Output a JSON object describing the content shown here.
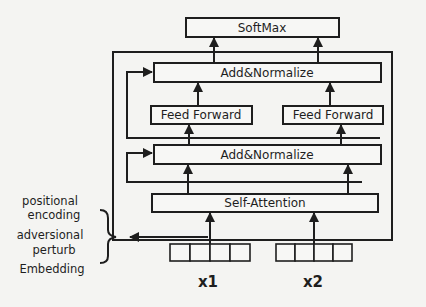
{
  "diagram": {
    "blocks": {
      "softmax": "SoftMax",
      "add_norm_top": "Add&Normalize",
      "feed_forward_left": "Feed Forward",
      "feed_forward_right": "Feed Forward",
      "add_norm_bottom": "Add&Normalize",
      "self_attention": "Self-Attention"
    },
    "side_labels": {
      "line1": "positional",
      "line2": "encoding",
      "line3": "adversional",
      "line4": "perturb",
      "line5": "Embedding"
    },
    "inputs": {
      "x1": "x1",
      "x2": "x2"
    },
    "colors": {
      "stroke": "#1e1e1e",
      "background": "#f4f4f2",
      "box_fill": "#f7f7f5"
    }
  }
}
